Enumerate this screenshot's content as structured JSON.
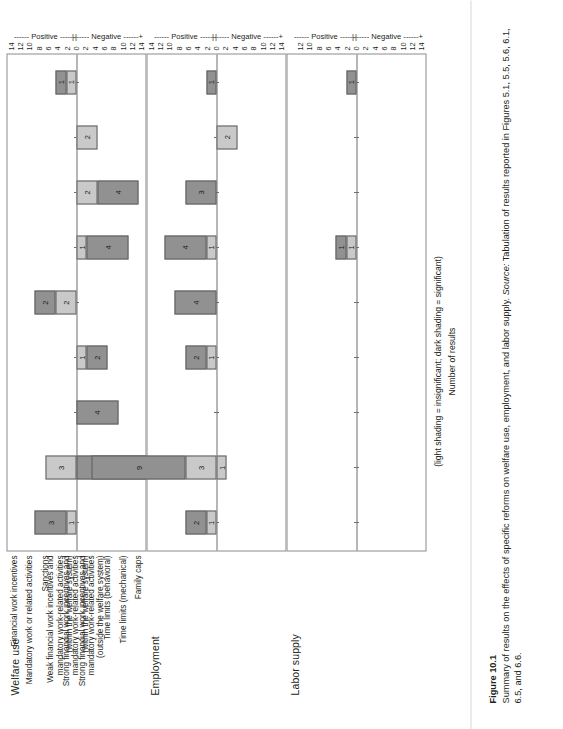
{
  "figure": {
    "number": "Figure 10.1",
    "caption_main": "Summary of results on the effects of specific reforms on welfare use, employment, and labor supply.",
    "caption_source_label": "Source:",
    "caption_source_text": "Tabulation of results reported in Figures 5.1, 5.5, 5.6, 6.1, 6.5, and 6.6."
  },
  "legend": {
    "shading_note": "(light shading = insignificant; dark shading = significant)",
    "axis_title": "Number of results"
  },
  "axis": {
    "negative_label": "Negative",
    "positive_label": "Positive",
    "band_left_bracket": "|",
    "band_mid": "+",
    "band_right_bracket": "|",
    "ticks_full": [
      "14",
      "12",
      "10",
      "8",
      "6",
      "4",
      "2",
      "0",
      "2",
      "4",
      "6",
      "8",
      "10",
      "12",
      "14"
    ],
    "ticks_labor": [
      "14",
      "12",
      "10",
      "8",
      "6",
      "4",
      "2",
      "0",
      "2",
      "4",
      "6",
      "8",
      "10",
      "12"
    ],
    "min": -15,
    "max": 15
  },
  "categories": [
    "Financial work incentives",
    "Mandatory work or related activities",
    "Sanctions",
    "Weak financial work incentives and\nmandatory work-related activities\n(within the welfare system)",
    "Strong financial work incentives and\nmandatory work-related activities\n(within the welfare system)",
    "Strong financial work incentives and\nmandatory work-related activities\n(outside the welfare system)",
    "Time limits (behavioral)",
    "Time limits (mechanical)",
    "Family caps"
  ],
  "colors": {
    "significant_dark": "#919191",
    "insignificant_light": "#c9c9c9",
    "axis_line": "#6f6f6f",
    "panel_border": "#8b8b8b",
    "text": "#231f20"
  },
  "chart_data": [
    {
      "type": "bar",
      "title": "Welfare use",
      "orientation": "vertical-diverging",
      "xlabel": "",
      "ylabel": "Number of results",
      "ylim": [
        -15,
        15
      ],
      "grid": false,
      "categories": [
        "Financial work incentives",
        "Mandatory work or related activities",
        "Sanctions",
        "Weak financial work incentives and mandatory work-related activities (within the welfare system)",
        "Strong financial work incentives and mandatory work-related activities (within the welfare system)",
        "Strong financial work incentives and mandatory work-related activities (outside the welfare system)",
        "Time limits (behavioral)",
        "Time limits (mechanical)",
        "Family caps"
      ],
      "series": [
        {
          "name": "Positive insignificant",
          "shading": "light",
          "values": [
            1,
            3,
            0,
            0,
            2,
            0,
            0,
            0,
            1
          ]
        },
        {
          "name": "Positive significant",
          "shading": "dark",
          "values": [
            3,
            0,
            0,
            0,
            2,
            0,
            0,
            0,
            1
          ]
        },
        {
          "name": "Negative insignificant",
          "shading": "light",
          "values": [
            0,
            0,
            0,
            1,
            0,
            1,
            2,
            2,
            0
          ]
        },
        {
          "name": "Negative significant",
          "shading": "dark",
          "values": [
            0,
            13,
            4,
            2,
            0,
            4,
            4,
            0,
            0
          ]
        }
      ]
    },
    {
      "type": "bar",
      "title": "Employment",
      "orientation": "vertical-diverging",
      "xlabel": "",
      "ylabel": "Number of results",
      "ylim": [
        -15,
        15
      ],
      "grid": false,
      "categories": [
        "Financial work incentives",
        "Mandatory work or related activities",
        "Sanctions",
        "Weak financial work incentives and mandatory work-related activities (within the welfare system)",
        "Strong financial work incentives and mandatory work-related activities (within the welfare system)",
        "Strong financial work incentives and mandatory work-related activities (outside the welfare system)",
        "Time limits (behavioral)",
        "Time limits (mechanical)",
        "Family caps"
      ],
      "series": [
        {
          "name": "Positive insignificant",
          "shading": "light",
          "values": [
            1,
            3,
            0,
            1,
            0,
            1,
            0,
            0,
            0
          ]
        },
        {
          "name": "Positive significant",
          "shading": "dark",
          "values": [
            2,
            9,
            0,
            2,
            4,
            4,
            3,
            0,
            1
          ]
        },
        {
          "name": "Negative insignificant",
          "shading": "light",
          "values": [
            0,
            1,
            0,
            0,
            0,
            0,
            0,
            2,
            0
          ]
        },
        {
          "name": "Negative significant",
          "shading": "dark",
          "values": [
            0,
            0,
            0,
            0,
            0,
            0,
            0,
            0,
            0
          ]
        }
      ]
    },
    {
      "type": "bar",
      "title": "Labor supply",
      "orientation": "vertical-diverging",
      "xlabel": "",
      "ylabel": "Number of results",
      "ylim": [
        -15,
        13
      ],
      "grid": false,
      "categories": [
        "Financial work incentives",
        "Mandatory work or related activities",
        "Sanctions",
        "Weak financial work incentives and mandatory work-related activities (within the welfare system)",
        "Strong financial work incentives and mandatory work-related activities (within the welfare system)",
        "Strong financial work incentives and mandatory work-related activities (outside the welfare system)",
        "Time limits (behavioral)",
        "Time limits (mechanical)",
        "Family caps"
      ],
      "series": [
        {
          "name": "Positive insignificant",
          "shading": "light",
          "values": [
            0,
            0,
            0,
            0,
            0,
            1,
            0,
            0,
            0
          ]
        },
        {
          "name": "Positive significant",
          "shading": "dark",
          "values": [
            0,
            0,
            0,
            0,
            0,
            1,
            0,
            0,
            1
          ]
        },
        {
          "name": "Negative insignificant",
          "shading": "light",
          "values": [
            0,
            0,
            0,
            0,
            0,
            0,
            0,
            0,
            0
          ]
        },
        {
          "name": "Negative significant",
          "shading": "dark",
          "values": [
            0,
            0,
            0,
            0,
            0,
            0,
            0,
            0,
            0
          ]
        }
      ]
    }
  ]
}
